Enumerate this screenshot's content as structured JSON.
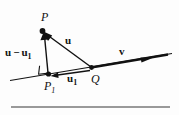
{
  "figure": {
    "name": "vector-projection-diagram",
    "type": "geometry-vector-diagram",
    "background_color": "#fdfdfd",
    "ink_color": "#111111",
    "rule_color": "#777777",
    "points": {
      "P": {
        "label": "P",
        "x": 42,
        "y": 31
      },
      "P1": {
        "label": "P",
        "subscript": "1",
        "x": 48,
        "y": 74
      },
      "Q": {
        "label": "Q",
        "x": 92,
        "y": 68
      }
    },
    "vectors": {
      "u": {
        "label": "u",
        "from": "Q",
        "to": "P"
      },
      "u1": {
        "label": "u",
        "subscript": "1",
        "from": "Q",
        "to": "P1"
      },
      "u_minus_u1": {
        "label": "u",
        "operator": "−",
        "label2": "u",
        "subscript2": "1",
        "from": "P1",
        "to": "P"
      },
      "v": {
        "label": "v",
        "along": "line"
      }
    },
    "markers": {
      "right_angle": {
        "name": "right-angle-marker",
        "at": "P1"
      }
    },
    "line": {
      "name": "direction-line",
      "start_x": 10,
      "start_y": 80,
      "end_x": 172,
      "end_y": 53
    },
    "bottom_rule": {
      "name": "bottom-rule",
      "start_x": 11,
      "end_x": 170,
      "y": 107
    }
  }
}
